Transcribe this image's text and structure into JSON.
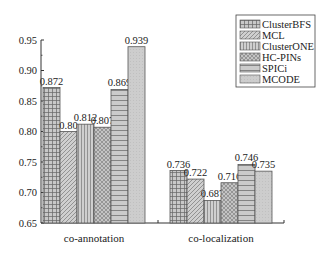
{
  "chart_data": {
    "type": "bar",
    "title": "",
    "xlabel": "",
    "ylabel": "",
    "ylim": [
      0.65,
      0.95
    ],
    "yticks": [
      "0.65",
      "0.70",
      "0.75",
      "0.80",
      "0.85",
      "0.90",
      "0.95"
    ],
    "grid": false,
    "legend_position": "upper right",
    "categories": [
      "co-annotation",
      "co-localization"
    ],
    "series": [
      {
        "name": "ClusterBFS",
        "values": [
          0.872,
          0.736
        ],
        "labels": [
          "0.872",
          "0.736"
        ],
        "pattern": "grid"
      },
      {
        "name": "MCL",
        "values": [
          0.8,
          0.722
        ],
        "labels": [
          "0.80",
          "0.722"
        ],
        "pattern": "diagonal"
      },
      {
        "name": "ClusterONE",
        "values": [
          0.812,
          0.687
        ],
        "labels": [
          "0.812",
          "0.687"
        ],
        "pattern": "vertical"
      },
      {
        "name": "HC-PINs",
        "values": [
          0.807,
          0.716
        ],
        "labels": [
          "0.807",
          "0.716"
        ],
        "pattern": "crosshatch"
      },
      {
        "name": "SPICi",
        "values": [
          0.869,
          0.746
        ],
        "labels": [
          "0.869",
          "0.746"
        ],
        "pattern": "horizontal"
      },
      {
        "name": "MCODE",
        "values": [
          0.939,
          0.735
        ],
        "labels": [
          "0.939",
          "0.735"
        ],
        "pattern": "dots"
      }
    ]
  },
  "colors": {
    "bar_fill": "#c8c8c8",
    "pattern_stroke": "#6a6a6a",
    "axis": "#333333"
  }
}
